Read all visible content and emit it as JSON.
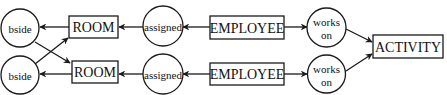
{
  "diagram": {
    "type": "entity-relationship",
    "entities": {
      "room_top": "ROOM",
      "room_bottom": "ROOM",
      "employee_top": "EMPLOYEE",
      "employee_bottom": "EMPLOYEE",
      "activity": "ACTIVITY"
    },
    "relationships": {
      "bside_top": "bside",
      "bside_bottom": "bside",
      "assigned_top": "assigned",
      "assigned_bottom": "assigned",
      "works_on_top": [
        "works",
        "on"
      ],
      "works_on_bottom": [
        "works",
        "on"
      ]
    },
    "edges": [
      {
        "from": "ROOM (top)",
        "to": "bside (top)"
      },
      {
        "from": "bside (bottom)",
        "to": "ROOM (top)"
      },
      {
        "from": "bside (top)",
        "to": "ROOM (bottom)"
      },
      {
        "from": "ROOM (bottom)",
        "to": "bside (bottom)"
      },
      {
        "from": "assigned (top)",
        "to": "ROOM (top)"
      },
      {
        "from": "assigned (bottom)",
        "to": "ROOM (bottom)"
      },
      {
        "from": "EMPLOYEE (top)",
        "to": "assigned (top)"
      },
      {
        "from": "EMPLOYEE (bottom)",
        "to": "assigned (bottom)"
      },
      {
        "from": "EMPLOYEE (top)",
        "to": "works on (top)"
      },
      {
        "from": "EMPLOYEE (bottom)",
        "to": "works on (bottom)"
      },
      {
        "from": "works on (top)",
        "to": "ACTIVITY"
      },
      {
        "from": "works on (bottom)",
        "to": "ACTIVITY"
      }
    ],
    "colors": {
      "stroke": "#1a1a1a",
      "fill": "#ffffff",
      "background": "#ffffff"
    }
  }
}
